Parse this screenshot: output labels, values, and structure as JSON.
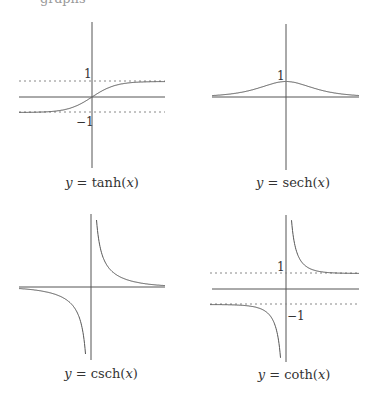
{
  "header": {
    "remnant_text": "graphs"
  },
  "chart_data": [
    {
      "type": "line",
      "title": "y = tanh(x)",
      "caption": {
        "prefix": "y",
        "eq": " = tanh(",
        "var": "x",
        "close": ")"
      },
      "function": "tanh",
      "tick_labels": [
        "1",
        "−1"
      ],
      "asymptotes_y": [
        1,
        -1
      ],
      "ylim": [
        -3,
        3
      ],
      "xlim": [
        -3,
        3
      ],
      "grid": false
    },
    {
      "type": "line",
      "title": "y = sech(x)",
      "caption": {
        "prefix": "y",
        "eq": " = sech(",
        "var": "x",
        "close": ")"
      },
      "function": "sech",
      "tick_labels": [
        "1"
      ],
      "asymptotes_y": [],
      "ylim": [
        -3,
        3
      ],
      "xlim": [
        -3,
        3
      ],
      "grid": false
    },
    {
      "type": "line",
      "title": "y = csch(x)",
      "caption": {
        "prefix": "y",
        "eq": " = csch(",
        "var": "x",
        "close": ")"
      },
      "function": "csch",
      "tick_labels": [],
      "asymptotes_y": [],
      "ylim": [
        -3,
        3
      ],
      "xlim": [
        -3,
        3
      ],
      "grid": false
    },
    {
      "type": "line",
      "title": "y = coth(x)",
      "caption": {
        "prefix": "y",
        "eq": " = coth(",
        "var": "x",
        "close": ")"
      },
      "function": "coth",
      "tick_labels": [
        "1",
        "−1"
      ],
      "asymptotes_y": [
        1,
        -1
      ],
      "ylim": [
        -3,
        3
      ],
      "xlim": [
        -3,
        3
      ],
      "grid": false
    }
  ]
}
